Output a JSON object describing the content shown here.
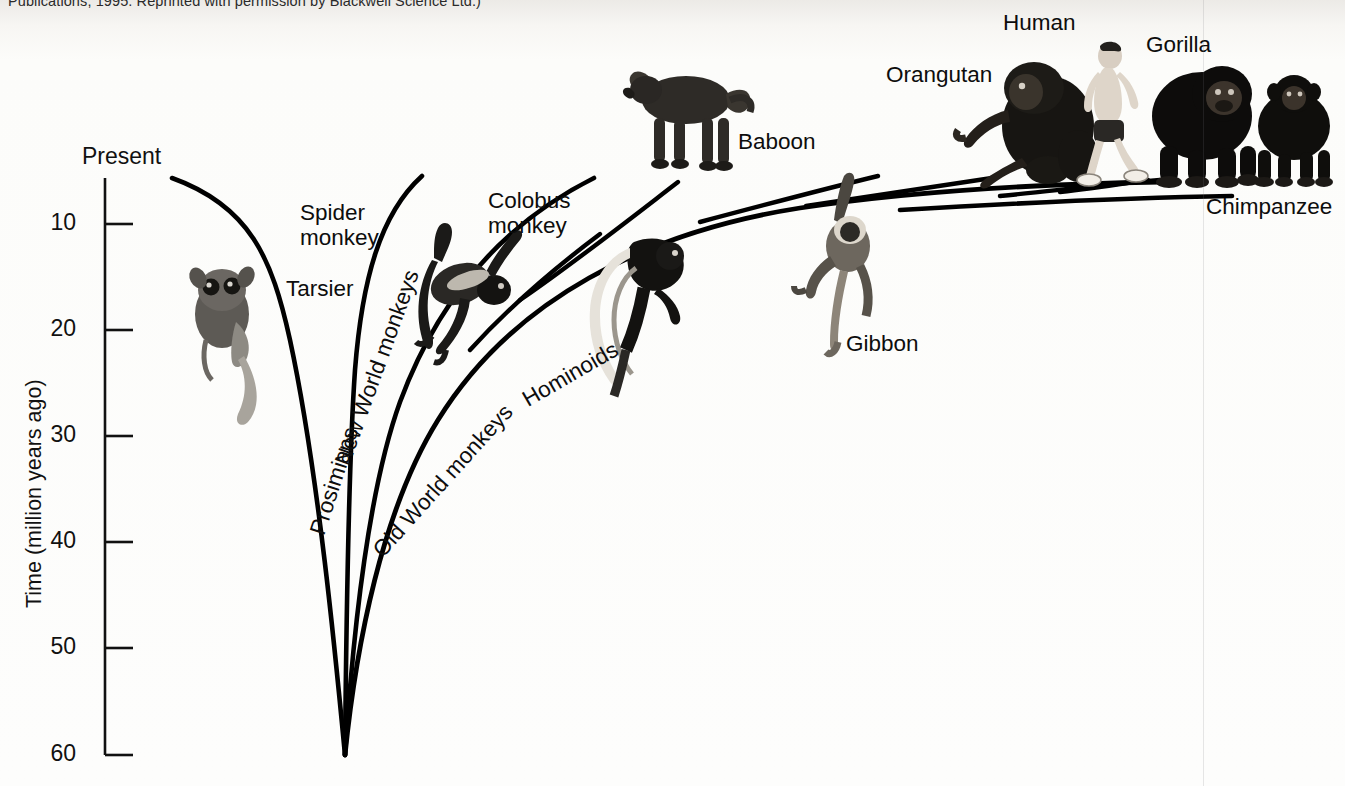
{
  "figure": {
    "caption_top": "Publications, 1995. Reprinted with permission by Blackwell Science Ltd.)",
    "background_color": "#fbfbf9",
    "ink_color": "#000000",
    "seam_x": 1203
  },
  "axis": {
    "title": "Time (million years ago)",
    "present_label": "Present",
    "ticks": [
      "10",
      "20",
      "30",
      "40",
      "50",
      "60"
    ],
    "tick_values": [
      10,
      20,
      30,
      40,
      50,
      60
    ],
    "axis_top_value": 5.5,
    "axis_bottom_value": 60,
    "orientation": "vertical-inverted"
  },
  "chart_data": {
    "type": "line",
    "xlabel": "",
    "ylabel": "Time (million years ago)",
    "ylim": [
      60,
      0
    ],
    "grid": false,
    "legend_position": "none",
    "root_divergence_mya": 60,
    "clades": [
      {
        "name": "Prosimians",
        "label_rotation_deg": -72,
        "divergence_from_root_mya": 60,
        "tip_mya": 5,
        "representative": "Tarsier"
      },
      {
        "name": "New World monkeys",
        "label_rotation_deg": -70,
        "divergence_from_root_mya": 60,
        "tip_mya": 5,
        "representative": "Spider monkey"
      },
      {
        "name": "Old World monkeys",
        "label_rotation_deg": -53,
        "divergence_from_root_mya": 60,
        "tip_mya": 5,
        "representative": "Colobus monkey"
      },
      {
        "name": "Hominoids",
        "label_rotation_deg": -30,
        "divergence_from_root_mya": 60,
        "tip_mya": 5,
        "representative": "Baboon"
      }
    ],
    "tips": [
      {
        "label": "Tarsier",
        "clade": "Prosimians",
        "tip_mya": 5
      },
      {
        "label": "Spider monkey",
        "clade": "New World monkeys",
        "tip_mya": 5
      },
      {
        "label": "Colobus monkey",
        "clade": "Old World monkeys",
        "tip_mya": 5
      },
      {
        "label": "Baboon",
        "clade": "Old World monkeys",
        "tip_mya": 5
      },
      {
        "label": "Gibbon",
        "clade": "Hominoids",
        "tip_mya": 5,
        "split_mya": 18
      },
      {
        "label": "Orangutan",
        "clade": "Hominoids",
        "tip_mya": 5,
        "split_mya": 14
      },
      {
        "label": "Gorilla",
        "clade": "Hominoids",
        "tip_mya": 5,
        "split_mya": 9
      },
      {
        "label": "Human",
        "clade": "Hominoids",
        "tip_mya": 5,
        "split_mya": 7
      },
      {
        "label": "Chimpanzee",
        "clade": "Hominoids",
        "tip_mya": 5,
        "split_mya": 7
      }
    ]
  },
  "labels": {
    "tarsier": "Tarsier",
    "spider_monkey": "Spider\nmonkey",
    "colobus_monkey": "Colobus\nmonkey",
    "baboon": "Baboon",
    "gibbon": "Gibbon",
    "orangutan": "Orangutan",
    "human": "Human",
    "gorilla": "Gorilla",
    "chimpanzee": "Chimpanzee",
    "prosimians": "Prosimians",
    "new_world_monkeys": "New World monkeys",
    "old_world_monkeys": "Old World monkeys",
    "hominoids": "Hominoids"
  },
  "icons": {
    "tarsier": "tarsier-illustration",
    "spider_monkey": "spider-monkey-illustration",
    "colobus_monkey": "colobus-monkey-illustration",
    "baboon": "baboon-illustration",
    "gibbon": "gibbon-illustration",
    "orangutan": "orangutan-illustration",
    "human": "human-illustration",
    "gorilla": "gorilla-illustration",
    "chimpanzee": "chimpanzee-illustration"
  }
}
